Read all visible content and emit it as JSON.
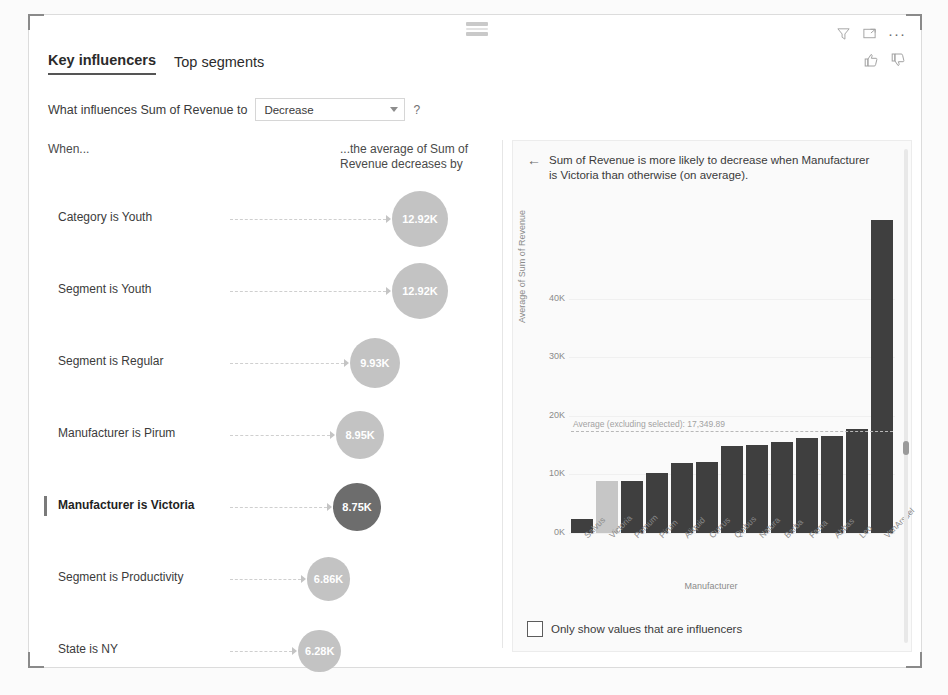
{
  "header": {
    "tabs": [
      {
        "label": "Key influencers",
        "active": true
      },
      {
        "label": "Top segments",
        "active": false
      }
    ],
    "icons": {
      "filter": "filter-icon",
      "focus": "focus-mode-icon",
      "more": "···",
      "thumbs_up": "thumbs-up-icon",
      "thumbs_down": "thumbs-down-icon"
    }
  },
  "question": {
    "prefix": "What influences Sum of Revenue to",
    "selected": "Decrease",
    "options": [
      "Increase",
      "Decrease"
    ],
    "help": "?"
  },
  "left_panel": {
    "col_when": "When...",
    "col_average": "...the average of Sum of Revenue decreases by",
    "influencers": [
      {
        "label": "Category is Youth",
        "value": "12.92K",
        "selected": false
      },
      {
        "label": "Segment is Youth",
        "value": "12.92K",
        "selected": false
      },
      {
        "label": "Segment is Regular",
        "value": "9.93K",
        "selected": false
      },
      {
        "label": "Manufacturer is Pirum",
        "value": "8.95K",
        "selected": false
      },
      {
        "label": "Manufacturer is Victoria",
        "value": "8.75K",
        "selected": true
      },
      {
        "label": "Segment is Productivity",
        "value": "6.86K",
        "selected": false
      },
      {
        "label": "State is NY",
        "value": "6.28K",
        "selected": false
      }
    ]
  },
  "right_panel": {
    "back": "←",
    "title": "Sum of Revenue is more likely to decrease when Manufacturer is Victoria than otherwise (on average).",
    "checkbox_label": "Only show values that are influencers",
    "checkbox_checked": false
  },
  "colors": {
    "bubble": "#c3c3c3",
    "bubble_selected": "#6d6d6d",
    "bar": "#3f3f3f",
    "bar_highlight": "#c6c6c6",
    "average_line": "#b8b8b8"
  },
  "chart_data": {
    "type": "bar",
    "title": "",
    "xlabel": "Manufacturer",
    "ylabel": "Average of Sum of Revenue",
    "ylim": [
      0,
      55000
    ],
    "yticks": [
      "0K",
      "10K",
      "20K",
      "30K",
      "40K"
    ],
    "ytick_values": [
      0,
      10000,
      20000,
      30000,
      40000
    ],
    "grid": true,
    "categories": [
      "Salvus",
      "Victoria",
      "Pomum",
      "Pirum",
      "Aliquid",
      "Currus",
      "Quibus",
      "Natura",
      "Barba",
      "Fama",
      "Abbas",
      "Leo",
      "VanArsdel"
    ],
    "values": [
      2400,
      8900,
      8800,
      10200,
      11900,
      12200,
      14800,
      15100,
      15600,
      16200,
      16600,
      17800,
      53500
    ],
    "highlight_category": "Victoria",
    "annotations": [
      {
        "type": "reference-line",
        "label": "Average (excluding selected): 17,349.89",
        "value": 17349.89
      }
    ]
  }
}
